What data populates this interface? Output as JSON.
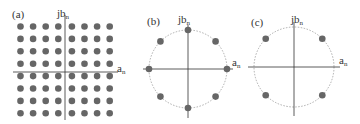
{
  "panels": [
    {
      "label": "(a)",
      "name": "square-constellation",
      "y_axis_label": "jb",
      "y_axis_sub": "n",
      "x_axis_label": "a",
      "x_axis_sub": "n",
      "points": "8x8 grid (64-QAM)"
    },
    {
      "label": "(b)",
      "name": "circular-8-point-constellation",
      "y_axis_label": "jb",
      "y_axis_sub": "n",
      "x_axis_label": "a",
      "x_axis_sub": "n",
      "points": "8 points on circle at 0°,45°,...,315° (8-PSK)"
    },
    {
      "label": "(c)",
      "name": "circular-4-point-constellation",
      "y_axis_label": "jb",
      "y_axis_sub": "n",
      "x_axis_label": "a",
      "x_axis_sub": "n",
      "points": "4 points on circle at 45°,135°,225°,315° (QPSK)"
    }
  ],
  "colors": {
    "dot": "#666666",
    "axis": "#333333",
    "circle": "#999999"
  }
}
